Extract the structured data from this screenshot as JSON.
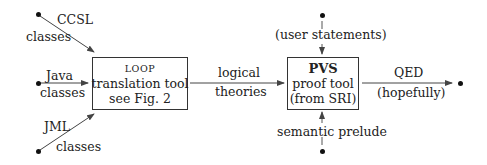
{
  "diagram": {
    "type": "flowchart",
    "nodes": {
      "loop": {
        "title": "LOOP",
        "line2": "translation tool",
        "line3": "see Fig. 2"
      },
      "pvs": {
        "title": "PVS",
        "line2": "proof tool",
        "line3": "(from SRI)"
      }
    },
    "inputs": {
      "ccsl": {
        "top": "CCSL",
        "bottom": "classes"
      },
      "java": {
        "top": "Java",
        "bottom": "classes"
      },
      "jml": {
        "top": "JML",
        "bottom": "classes"
      }
    },
    "edges": {
      "loop_to_pvs": {
        "top": "logical",
        "bottom": "theories"
      },
      "user_statements": {
        "label": "(user statements)"
      },
      "semantic_prelude": {
        "label": "semantic prelude"
      },
      "output": {
        "top": "QED",
        "bottom": "(hopefully)"
      }
    },
    "colors": {
      "line": "#444444",
      "dashed": "#555555",
      "text": "#222222"
    }
  }
}
